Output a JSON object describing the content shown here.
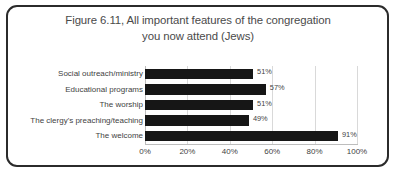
{
  "chart_data": {
    "type": "bar",
    "orientation": "horizontal",
    "title": "Figure 6.11, All important features of the congregation you now attend (Jews)",
    "title_lines": [
      "Figure 6.11, All important features of the congregation",
      "you now attend (Jews)"
    ],
    "xlabel": "",
    "ylabel": "",
    "categories": [
      "Social outreach/ministry",
      "Educational programs",
      "The worship",
      "The clergy's preaching/teaching",
      "The welcome"
    ],
    "values": [
      51,
      57,
      51,
      49,
      91
    ],
    "value_labels": [
      "51%",
      "57%",
      "51%",
      "49%",
      "91%"
    ],
    "xlim": [
      0,
      100
    ],
    "xticks": [
      0,
      20,
      40,
      60,
      80,
      100
    ],
    "xtick_labels": [
      "0%",
      "20%",
      "40%",
      "60%",
      "80%",
      "100%"
    ],
    "grid": true,
    "legend": false,
    "bar_color": "#161616",
    "gridline_color": "#d9d9d9",
    "text_color": "#3f3f3f",
    "title_color": "#4a4a4a",
    "frame_color": "#2b2b2b",
    "background_color": "#ffffff"
  }
}
